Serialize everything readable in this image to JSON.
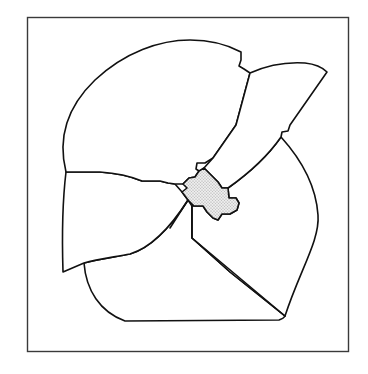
{
  "figure": {
    "title": "",
    "colors": {
      "background": "#ffffff",
      "outline": "#111111",
      "frame": "#3a3a3a",
      "shaded_fill": "#d9d9d9"
    },
    "segments": [
      {
        "id": "upper-left-lobe",
        "shaded": false
      },
      {
        "id": "upper-right-lobe",
        "shaded": false
      },
      {
        "id": "left-lobe",
        "shaded": false
      },
      {
        "id": "bottom-lobe",
        "shaded": false
      },
      {
        "id": "right-lobe",
        "shaded": false
      },
      {
        "id": "central-region",
        "shaded": true
      }
    ]
  }
}
